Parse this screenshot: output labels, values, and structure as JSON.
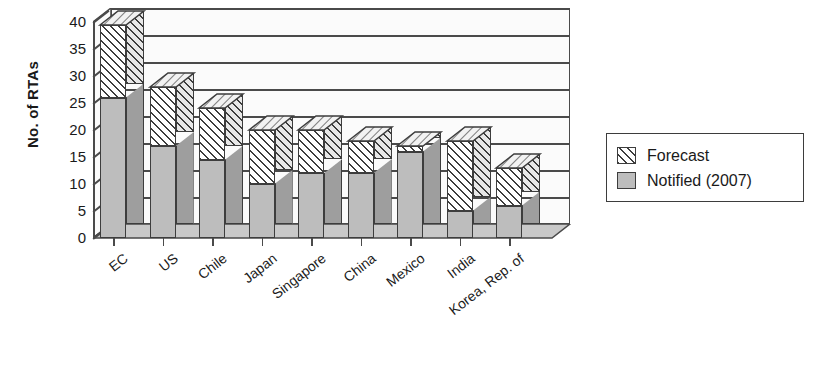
{
  "chart_data": {
    "type": "bar",
    "stacked": true,
    "three_d": true,
    "title": "",
    "xlabel": "",
    "ylabel": "No. of RTAs",
    "ylim": [
      0,
      40
    ],
    "ytick_step": 5,
    "yticks": [
      "40",
      "35",
      "30",
      "25",
      "20",
      "15",
      "10",
      "5",
      "0"
    ],
    "grid": true,
    "legend_position": "right",
    "categories": [
      "EC",
      "US",
      "Chile",
      "Japan",
      "Singapore",
      "China",
      "Mexico",
      "India",
      "Korea, Rep. of"
    ],
    "series": [
      {
        "name": "Notified (2007)",
        "values": [
          26,
          17,
          14.5,
          10,
          12,
          12,
          16,
          5,
          6
        ],
        "color": "#bdbdbd",
        "pattern": "solid-gray"
      },
      {
        "name": "Forecast",
        "values": [
          13.5,
          11,
          9.5,
          10,
          8,
          6,
          1,
          13,
          7
        ],
        "color": "#ffffff",
        "pattern": "diagonal-hatch"
      }
    ],
    "totals": [
      39.5,
      28,
      24,
      20,
      20,
      18,
      17,
      18,
      13
    ]
  },
  "legend": {
    "items": [
      {
        "label": "Forecast",
        "swatch": "diagonal-hatch"
      },
      {
        "label": "Notified (2007)",
        "swatch": "solid-gray"
      }
    ]
  }
}
